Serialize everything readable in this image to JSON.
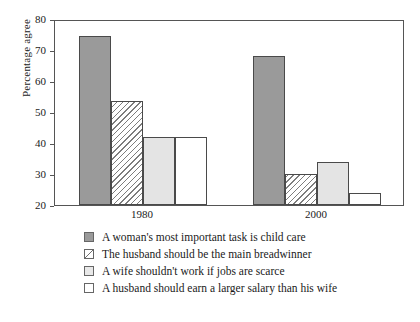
{
  "chart_data": {
    "type": "bar",
    "title": "",
    "xlabel": "",
    "ylabel": "Percentage agree",
    "ylim": [
      20,
      80
    ],
    "yticks": [
      20,
      30,
      40,
      50,
      60,
      70,
      80
    ],
    "ytick_labels": [
      "20",
      "30",
      "40",
      "50",
      "60",
      "70",
      "80"
    ],
    "grid": false,
    "legend_position": "below",
    "categories": [
      "1980",
      "2000"
    ],
    "series": [
      {
        "name": "A woman's most important task is child care",
        "style": "solid",
        "values": [
          74.5,
          68
        ]
      },
      {
        "name": "The husband should be the main breadwinner",
        "style": "hatch",
        "values": [
          53.5,
          30
        ]
      },
      {
        "name": "A wife shouldn't work if jobs are scarce",
        "style": "light",
        "values": [
          42,
          34
        ]
      },
      {
        "name": "A husband should earn a larger salary than his wife",
        "style": "white",
        "values": [
          42,
          24
        ]
      }
    ]
  },
  "colors": {
    "solid": "#9a9a9a",
    "light": "#e4e4e4",
    "white": "#ffffff",
    "hatch_line": "#7d7d7d",
    "frame": "#555555",
    "text": "#1a1a1a"
  }
}
